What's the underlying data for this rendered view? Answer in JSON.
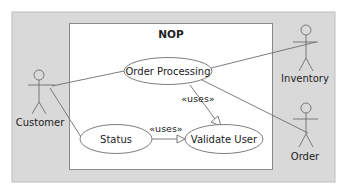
{
  "diagram": {
    "type": "uml-use-case",
    "system_boundary": {
      "title": "NOP"
    },
    "actors": [
      {
        "id": "customer",
        "label": "Customer"
      },
      {
        "id": "inventory",
        "label": "Inventory"
      },
      {
        "id": "order",
        "label": "Order"
      }
    ],
    "use_cases": [
      {
        "id": "order_processing",
        "label": "Order Processing"
      },
      {
        "id": "status",
        "label": "Status"
      },
      {
        "id": "validate_user",
        "label": "Validate User"
      }
    ],
    "relationships": [
      {
        "from": "customer",
        "to": "order_processing",
        "type": "association"
      },
      {
        "from": "customer",
        "to": "status",
        "type": "association"
      },
      {
        "from": "order_processing",
        "to": "inventory",
        "type": "association"
      },
      {
        "from": "order_processing",
        "to": "order",
        "type": "association"
      },
      {
        "from": "order_processing",
        "to": "validate_user",
        "type": "uses",
        "label": "«uses»"
      },
      {
        "from": "status",
        "to": "validate_user",
        "type": "uses",
        "label": "«uses»"
      }
    ]
  },
  "colors": {
    "outer_background": "#d9d9d9",
    "system_box": "#ffffff",
    "stroke": "#6e6e6e",
    "text": "#222222"
  }
}
